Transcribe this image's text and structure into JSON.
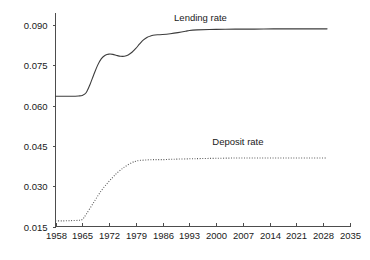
{
  "chart_data": {
    "type": "line",
    "title": "",
    "subtitle": "",
    "xlabel": "",
    "ylabel": "",
    "xlim": [
      1958,
      2035
    ],
    "ylim": [
      0.015,
      0.0945
    ],
    "grid": false,
    "legend_position": "inline-annotation",
    "x_ticks": [
      1958,
      1965,
      1972,
      1979,
      1986,
      1993,
      2000,
      2007,
      2014,
      2021,
      2028,
      2035
    ],
    "x_tick_labels": [
      "1958",
      "1965",
      "1972",
      "1979",
      "1986",
      "1993",
      "2000",
      "2007",
      "2014",
      "2021",
      "2028",
      "2035"
    ],
    "y_ticks": [
      0.015,
      0.03,
      0.045,
      0.06,
      0.075,
      0.09
    ],
    "y_tick_labels": [
      "0.015",
      "0.030",
      "0.045",
      "0.060",
      "0.075",
      "0.090"
    ],
    "annotations": [
      {
        "text": "Lending rate",
        "x": 1989,
        "y": 0.0915
      },
      {
        "text": "Deposit rate",
        "x": 1999,
        "y": 0.0455
      }
    ],
    "series": [
      {
        "name": "Lending rate",
        "style": "solid",
        "color": "#3d3d3d",
        "x": [
          1958,
          1960,
          1962,
          1964,
          1965,
          1966,
          1967,
          1968,
          1969,
          1970,
          1971,
          1972,
          1973,
          1974,
          1975,
          1976,
          1977,
          1978,
          1979,
          1980,
          1981,
          1982,
          1983,
          1984,
          1985,
          1986,
          1988,
          1990,
          1992,
          1993,
          1995,
          2000,
          2005,
          2010,
          2015,
          2020,
          2025,
          2029
        ],
        "values": [
          0.0635,
          0.0635,
          0.0635,
          0.0636,
          0.0638,
          0.0648,
          0.0678,
          0.0715,
          0.075,
          0.0775,
          0.0788,
          0.0792,
          0.0791,
          0.0787,
          0.0784,
          0.0784,
          0.0789,
          0.0799,
          0.0813,
          0.083,
          0.0845,
          0.0855,
          0.086,
          0.0863,
          0.0864,
          0.0865,
          0.0868,
          0.0872,
          0.0877,
          0.088,
          0.0882,
          0.0884,
          0.0885,
          0.0885,
          0.0886,
          0.0886,
          0.0886,
          0.0886
        ]
      },
      {
        "name": "Deposit rate",
        "style": "dotted",
        "color": "#5a5a5a",
        "x": [
          1958,
          1960,
          1962,
          1964,
          1965,
          1966,
          1968,
          1970,
          1972,
          1974,
          1976,
          1978,
          1979,
          1980,
          1982,
          1984,
          1986,
          1988,
          1990,
          1993,
          1996,
          2000,
          2005,
          2010,
          2015,
          2020,
          2025,
          2029
        ],
        "values": [
          0.0171,
          0.0171,
          0.0172,
          0.0173,
          0.0176,
          0.0195,
          0.024,
          0.0284,
          0.0318,
          0.0348,
          0.0371,
          0.0388,
          0.0393,
          0.0396,
          0.0398,
          0.0399,
          0.0399,
          0.04,
          0.0401,
          0.0402,
          0.0403,
          0.0404,
          0.0405,
          0.0405,
          0.0405,
          0.0405,
          0.0405,
          0.0405
        ]
      }
    ]
  },
  "axes": {
    "y_axis_name": "rate-axis",
    "x_axis_name": "year-axis"
  }
}
